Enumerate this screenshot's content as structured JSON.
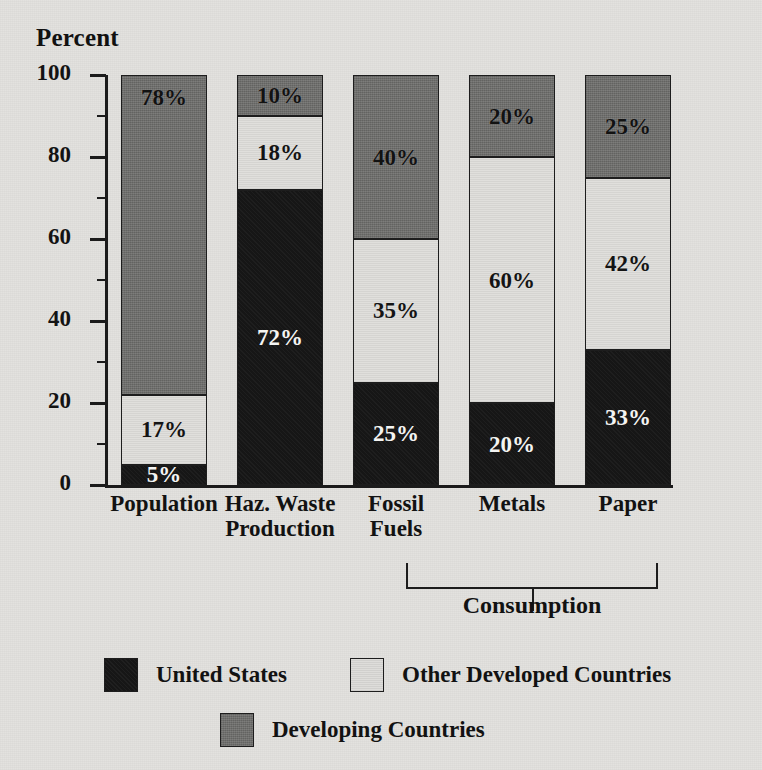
{
  "chart_data": {
    "type": "bar",
    "subtype": "stacked-bar-100",
    "title": "",
    "ylabel": "Percent",
    "xlabel": "",
    "ylim": [
      0,
      100
    ],
    "y_ticks_major": [
      0,
      20,
      40,
      60,
      80,
      100
    ],
    "y_ticks_minor": [
      10,
      30,
      50,
      70,
      90
    ],
    "grid": false,
    "legend_position": "bottom",
    "categories": [
      "Population",
      "Haz. Waste\nProduction",
      "Fossil\nFuels",
      "Metals",
      "Paper"
    ],
    "series": [
      {
        "name": "United States",
        "color": "#161616",
        "values": [
          5,
          72,
          25,
          20,
          33
        ],
        "labels": [
          "5%",
          "72%",
          "25%",
          "20%",
          "33%"
        ]
      },
      {
        "name": "Other Developed Countries",
        "color": "#e0dfdc",
        "values": [
          17,
          18,
          35,
          60,
          42
        ],
        "labels": [
          "17%",
          "18%",
          "35%",
          "60%",
          "42%"
        ]
      },
      {
        "name": "Developing Countries",
        "color": "#6e6e6c",
        "values": [
          78,
          10,
          40,
          20,
          25
        ],
        "labels": [
          "78%",
          "10%",
          "40%",
          "20%",
          "25%"
        ]
      }
    ],
    "annotations": [
      {
        "text": "Consumption",
        "type": "bracket",
        "spans_categories": [
          "Fossil Fuels",
          "Metals",
          "Paper"
        ]
      }
    ]
  },
  "axis": {
    "title": "Percent",
    "ticks": [
      "100",
      "80",
      "60",
      "40",
      "20",
      "0"
    ]
  },
  "legend": {
    "items": [
      {
        "label": "United States",
        "swatch": "black-swatch"
      },
      {
        "label": "Other Developed Countries",
        "swatch": "light-gray-swatch"
      },
      {
        "label": "Developing Countries",
        "swatch": "dark-gray-swatch"
      }
    ]
  },
  "bracket": {
    "label": "Consumption"
  },
  "colors": {
    "background": "#e3e2df",
    "united_states": "#161616",
    "other_developed": "#e0dfdc",
    "developing": "#6e6e6c",
    "ink": "#1b1b1b"
  }
}
